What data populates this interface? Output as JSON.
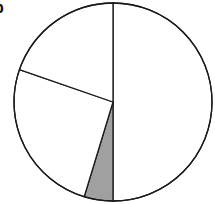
{
  "panel_label": "b",
  "chart_data": {
    "type": "pie",
    "title": "",
    "start_angle_deg": 0,
    "direction": "clockwise",
    "slices": [
      {
        "label": "",
        "value": 50.0,
        "color": "#ffffff"
      },
      {
        "label": "",
        "value": 4.7,
        "color": "#a0a0a0"
      },
      {
        "label": "",
        "value": 25.6,
        "color": "#ffffff"
      },
      {
        "label": "",
        "value": 19.7,
        "color": "#ffffff"
      }
    ],
    "legend": [],
    "stroke_color": "#1a1a1a"
  },
  "geometry": {
    "cx": 113,
    "cy": 102,
    "r": 99
  }
}
